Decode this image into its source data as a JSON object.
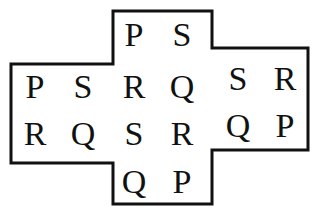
{
  "figure": {
    "background_color": "#ffffff",
    "outline_color": "#111111",
    "outline_width": 3,
    "text_color": "#111111",
    "outline_points": "113,11 212,11 212,48 308,48 308,150 212,150 212,204 113,204 113,163 11,163 11,64 113,64",
    "blocks": [
      {
        "name": "top-block",
        "rows": [
          [
            "P",
            "S"
          ]
        ]
      },
      {
        "name": "left-block",
        "rows": [
          [
            "P",
            "S"
          ],
          [
            "R",
            "Q"
          ]
        ]
      },
      {
        "name": "center-block",
        "rows": [
          [
            "R",
            "Q"
          ],
          [
            "S",
            "R"
          ]
        ]
      },
      {
        "name": "right-block",
        "rows": [
          [
            "S",
            "R"
          ],
          [
            "Q",
            "P"
          ]
        ]
      },
      {
        "name": "bottom-block",
        "rows": [
          [
            "Q",
            "P"
          ]
        ]
      }
    ],
    "letters": [
      {
        "id": "top-left",
        "char": "P",
        "x": 134,
        "y": 35
      },
      {
        "id": "top-right",
        "char": "S",
        "x": 182,
        "y": 35
      },
      {
        "id": "left-top-left",
        "char": "P",
        "x": 35,
        "y": 87
      },
      {
        "id": "left-top-right",
        "char": "S",
        "x": 83,
        "y": 87
      },
      {
        "id": "left-bot-left",
        "char": "R",
        "x": 35,
        "y": 134
      },
      {
        "id": "left-bot-right",
        "char": "Q",
        "x": 83,
        "y": 134
      },
      {
        "id": "center-top-left",
        "char": "R",
        "x": 134,
        "y": 87
      },
      {
        "id": "center-top-right",
        "char": "Q",
        "x": 182,
        "y": 87
      },
      {
        "id": "center-bot-left",
        "char": "S",
        "x": 134,
        "y": 134
      },
      {
        "id": "center-bot-right",
        "char": "R",
        "x": 182,
        "y": 134
      },
      {
        "id": "right-top-left",
        "char": "S",
        "x": 238,
        "y": 79
      },
      {
        "id": "right-top-right",
        "char": "R",
        "x": 285,
        "y": 79
      },
      {
        "id": "right-bot-left",
        "char": "Q",
        "x": 238,
        "y": 126
      },
      {
        "id": "right-bot-right",
        "char": "P",
        "x": 285,
        "y": 126
      },
      {
        "id": "bottom-left",
        "char": "Q",
        "x": 134,
        "y": 182
      },
      {
        "id": "bottom-right",
        "char": "P",
        "x": 182,
        "y": 182
      }
    ]
  }
}
